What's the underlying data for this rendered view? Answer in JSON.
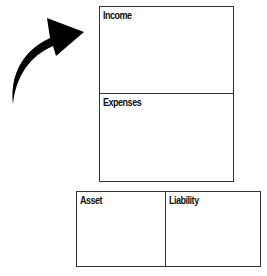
{
  "diagram": {
    "arrow": {
      "icon": "curved-arrow-icon",
      "direction": "up-right",
      "color": "#000000"
    },
    "top_group": {
      "boxes": [
        {
          "id": "income",
          "label": "Income"
        },
        {
          "id": "expenses",
          "label": "Expenses"
        }
      ]
    },
    "bottom_group": {
      "boxes": [
        {
          "id": "asset",
          "label": "Asset"
        },
        {
          "id": "liability",
          "label": "Liability"
        }
      ]
    },
    "colors": {
      "border": "#333333",
      "text": "#111111",
      "background": "#ffffff"
    }
  }
}
